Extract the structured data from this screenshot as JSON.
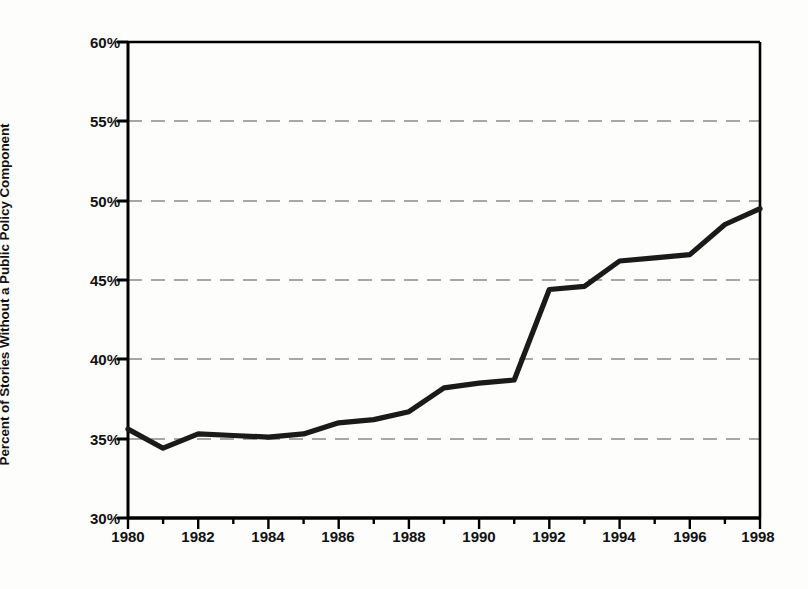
{
  "chart_data": {
    "type": "line",
    "title": "",
    "xlabel": "",
    "ylabel": "Percent of Stories Without a Public Policy Component",
    "x": [
      1980,
      1981,
      1982,
      1983,
      1984,
      1985,
      1986,
      1987,
      1988,
      1989,
      1990,
      1991,
      1992,
      1993,
      1994,
      1995,
      1996,
      1997,
      1998
    ],
    "values": [
      35.6,
      34.4,
      35.3,
      35.2,
      35.1,
      35.3,
      36.0,
      36.2,
      36.7,
      38.2,
      38.5,
      38.7,
      44.4,
      44.6,
      46.2,
      46.4,
      46.6,
      48.5,
      49.5
    ],
    "series": [
      {
        "name": "Percent of Stories Without a Public Policy Component",
        "values": [
          35.6,
          34.4,
          35.3,
          35.2,
          35.1,
          35.3,
          36.0,
          36.2,
          36.7,
          38.2,
          38.5,
          38.7,
          44.4,
          44.6,
          46.2,
          46.4,
          46.6,
          48.5,
          49.5
        ]
      }
    ],
    "xlim": [
      1980,
      1998
    ],
    "ylim": [
      30,
      60
    ],
    "y_tick_labels": [
      "60%",
      "55%",
      "50%",
      "45%",
      "40%",
      "35%",
      "30%"
    ],
    "y_tick_values": [
      60,
      55,
      50,
      45,
      40,
      35,
      30
    ],
    "x_tick_labels": [
      "1980",
      "1982",
      "1984",
      "1986",
      "1988",
      "1990",
      "1992",
      "1994",
      "1996",
      "1998"
    ],
    "x_tick_values": [
      1980,
      1982,
      1984,
      1986,
      1988,
      1990,
      1992,
      1994,
      1996,
      1998
    ],
    "x_minor_tick_step": 1,
    "grid": "horizontal-dashed",
    "legend": "none",
    "line_color": "#1a1a1a",
    "grid_color": "#8a8a8a",
    "axis_color": "#000000",
    "background_color": "#ffffff"
  }
}
